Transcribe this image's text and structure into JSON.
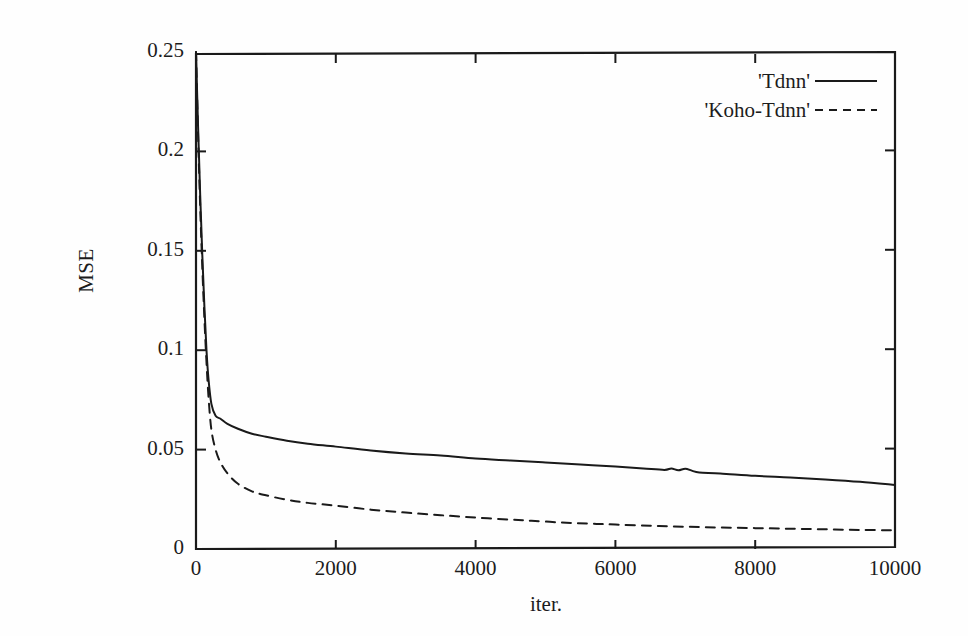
{
  "chart_data": {
    "type": "line",
    "title": "",
    "xlabel": "iter.",
    "ylabel": "MSE",
    "xlim": [
      0,
      10000
    ],
    "ylim": [
      0,
      0.25
    ],
    "grid": false,
    "legend_position": "top-right",
    "xticks": [
      0,
      2000,
      4000,
      6000,
      8000,
      10000
    ],
    "xtick_labels": [
      "0",
      "2000",
      "4000",
      "6000",
      "8000",
      "10000"
    ],
    "yticks": [
      0,
      0.05,
      0.1,
      0.15,
      0.2,
      0.25
    ],
    "ytick_labels": [
      "0",
      "0.05",
      "0.1",
      "0.15",
      "0.2",
      "0.25"
    ],
    "series": [
      {
        "name": "'Tdnn'",
        "style": "solid",
        "color": "#1a1a1a",
        "x": [
          0,
          30,
          60,
          90,
          120,
          150,
          180,
          220,
          280,
          350,
          450,
          600,
          800,
          1000,
          1300,
          1600,
          2000,
          2500,
          3000,
          3500,
          4000,
          4500,
          5000,
          5500,
          6000,
          6400,
          6700,
          6800,
          6900,
          7000,
          7100,
          7200,
          7500,
          8000,
          8500,
          9000,
          9500,
          10000
        ],
        "y": [
          0.25,
          0.212,
          0.178,
          0.148,
          0.122,
          0.1,
          0.085,
          0.073,
          0.067,
          0.0655,
          0.063,
          0.0605,
          0.058,
          0.0565,
          0.0545,
          0.053,
          0.0515,
          0.0495,
          0.048,
          0.047,
          0.0455,
          0.0445,
          0.0435,
          0.0425,
          0.0415,
          0.0405,
          0.0398,
          0.0405,
          0.0396,
          0.0404,
          0.0393,
          0.0385,
          0.038,
          0.0368,
          0.036,
          0.035,
          0.0338,
          0.0322
        ]
      },
      {
        "name": "'Koho-Tdnn'",
        "style": "dashed",
        "color": "#1a1a1a",
        "x": [
          0,
          30,
          60,
          90,
          120,
          150,
          180,
          220,
          280,
          350,
          450,
          600,
          800,
          1000,
          1300,
          1600,
          2000,
          2500,
          3000,
          3500,
          4000,
          4500,
          4800,
          5200,
          5600,
          6000,
          6500,
          7000,
          7500,
          8000,
          8500,
          9000,
          9500,
          10000
        ],
        "y": [
          0.25,
          0.208,
          0.172,
          0.142,
          0.116,
          0.094,
          0.076,
          0.06,
          0.05,
          0.0435,
          0.038,
          0.0328,
          0.029,
          0.027,
          0.0248,
          0.0232,
          0.0218,
          0.0198,
          0.0183,
          0.017,
          0.0158,
          0.0148,
          0.0142,
          0.0134,
          0.0128,
          0.0123,
          0.0117,
          0.0112,
          0.0108,
          0.0105,
          0.0102,
          0.0099,
          0.0096,
          0.0094
        ]
      }
    ]
  },
  "legend": {
    "entries": [
      {
        "label": "'Tdnn'",
        "style": "solid"
      },
      {
        "label": "'Koho-Tdnn'",
        "style": "dashed"
      }
    ]
  },
  "colors": {
    "ink": "#1a1a1a",
    "paper": "#fefefe"
  }
}
